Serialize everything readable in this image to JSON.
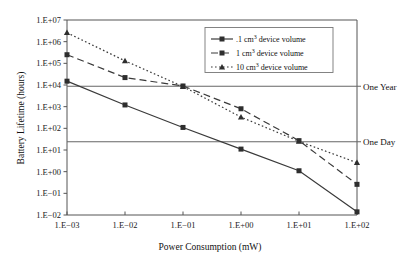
{
  "chart_data": {
    "type": "line",
    "title": "",
    "xlabel": "Power Consumption (mW)",
    "ylabel": "Battery Lifetime (hours)",
    "x_scale": "log",
    "y_scale": "log",
    "xlim": [
      0.001,
      100
    ],
    "ylim": [
      0.01,
      10000000
    ],
    "grid": false,
    "legend_position": "top-right",
    "x_tick_labels": [
      "1.E−03",
      "1.E−02",
      "1.E−01",
      "1.E+00",
      "1.E+01",
      "1.E+02"
    ],
    "x_tick_values": [
      0.001,
      0.01,
      0.1,
      1,
      10,
      100
    ],
    "y_tick_labels": [
      "1.E−02",
      "1.E−01",
      "1.E+00",
      "1.E+01",
      "1.E+02",
      "1.E+03",
      "1.E+04",
      "1.E+05",
      "1.E+06",
      "1.E+07"
    ],
    "y_tick_values": [
      0.01,
      0.1,
      1,
      10,
      100,
      1000,
      10000,
      100000,
      1000000,
      10000000
    ],
    "x": [
      0.001,
      0.01,
      0.1,
      1,
      10,
      100
    ],
    "series": [
      {
        "name": ".1 cm³ device volume",
        "legend_label_main": ".1 cm",
        "legend_label_sup": "3",
        "legend_label_tail": " device volume",
        "line_style": "solid",
        "marker": "square",
        "color": "#3a3a3a",
        "values": [
          15000,
          1200,
          110,
          11,
          1.1,
          0.014
        ]
      },
      {
        "name": "1 cm³ device volume",
        "legend_label_main": "1 cm",
        "legend_label_sup": "3",
        "legend_label_tail": " device volume",
        "line_style": "dashed",
        "marker": "square",
        "color": "#3a3a3a",
        "values": [
          250000,
          22000,
          9000,
          800,
          27,
          0.26
        ]
      },
      {
        "name": "10 cm³ device volume",
        "legend_label_main": "10 cm",
        "legend_label_sup": "3",
        "legend_label_tail": " device volume",
        "line_style": "dotted",
        "marker": "triangle",
        "color": "#3a3a3a",
        "values": [
          2600000,
          130000,
          8500,
          330,
          25,
          2.6
        ]
      }
    ],
    "annotations": [
      {
        "label": "One Year",
        "type": "hline",
        "y_value": 8760
      },
      {
        "label": "One Day",
        "type": "hline",
        "y_value": 24
      }
    ]
  },
  "colors": {
    "axis": "#555555",
    "line": "#3a3a3a",
    "annotation_line": "#666666",
    "legend_border": "#777777",
    "background": "#ffffff"
  }
}
